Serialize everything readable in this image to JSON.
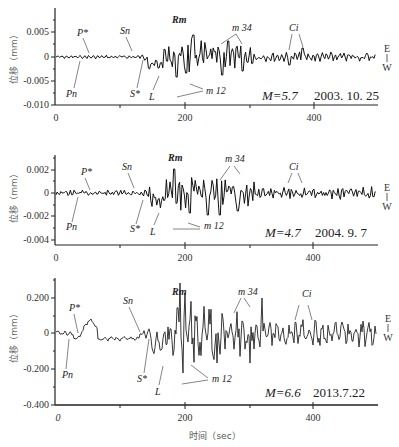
{
  "chart_data": [
    {
      "type": "line",
      "title": "",
      "annotation": "M=5.7  2003. 10. 25",
      "magnitude_label": "M=5.7",
      "date_label": "2003. 10. 25",
      "xlabel": "",
      "ylabel": "位移（mm）",
      "xlim": [
        0,
        500
      ],
      "ylim": [
        -0.01,
        0.01
      ],
      "xticks": [
        "0",
        "200",
        "400"
      ],
      "yticks": [
        "0.005",
        "0",
        "-0.005",
        "-0.010"
      ],
      "component": [
        "E",
        "W"
      ],
      "phases": [
        "P*",
        "Pn",
        "Sn",
        "S*",
        "L",
        "Rm",
        "m 12",
        "m 34",
        "Ci"
      ],
      "series": [
        {
          "name": "EW displacement",
          "peak_min": -0.008,
          "peak_max": 0.004
        }
      ]
    },
    {
      "type": "line",
      "title": "",
      "annotation": "M=4.7  2004. 9. 7",
      "magnitude_label": "M=4.7",
      "date_label": "2004. 9. 7",
      "xlabel": "",
      "ylabel": "位移（mm）",
      "xlim": [
        0,
        500
      ],
      "ylim": [
        -0.004,
        0.003
      ],
      "xticks": [
        "0",
        "200",
        "400"
      ],
      "yticks": [
        "0.002",
        "0",
        "-0.002",
        "-0.004"
      ],
      "component": [
        "E",
        "W"
      ],
      "phases": [
        "P*",
        "Pn",
        "Sn",
        "S*",
        "L",
        "Rm",
        "m 12",
        "m 34",
        "Ci"
      ],
      "series": [
        {
          "name": "EW displacement",
          "peak_min": -0.0026,
          "peak_max": 0.0022
        }
      ]
    },
    {
      "type": "line",
      "title": "",
      "annotation": "M=6.6  2013.7.22",
      "magnitude_label": "M=6.6",
      "date_label": "2013.7.22",
      "xlabel": "时间（sec）",
      "ylabel": "位移（mm）",
      "xlim": [
        0,
        500
      ],
      "ylim": [
        -0.4,
        0.3
      ],
      "xticks": [
        "0",
        "200",
        "400"
      ],
      "yticks": [
        "0.200",
        "0",
        "-0.200",
        "-0.400"
      ],
      "component": [
        "E",
        "W"
      ],
      "phases": [
        "P*",
        "Pn",
        "Sn",
        "S*",
        "L",
        "Rm",
        "m 12",
        "m 34",
        "Ci"
      ],
      "series": [
        {
          "name": "EW displacement",
          "peak_min": -0.26,
          "peak_max": 0.21
        }
      ]
    }
  ],
  "panels": [
    {
      "yticks": [
        "0.005",
        "0",
        "-0.005",
        "-0.010"
      ],
      "xticks": [
        "0",
        "200",
        "400"
      ],
      "ylabel": "位移（mm）",
      "mag": "M=5.7",
      "date": "2003. 10. 25",
      "phases": {
        "p": "P*",
        "pn": "Pn",
        "sn": "Sn",
        "s": "S*",
        "l": "L",
        "rm": "Rm",
        "m12": "m 12",
        "m34": "m 34",
        "ci": "Ci"
      },
      "e": "E",
      "w": "W"
    },
    {
      "yticks": [
        "0.002",
        "0",
        "-0.002",
        "-0.004"
      ],
      "xticks": [
        "0",
        "200",
        "400"
      ],
      "ylabel": "位移（mm）",
      "mag": "M=4.7",
      "date": "2004. 9. 7",
      "phases": {
        "p": "P*",
        "pn": "Pn",
        "sn": "Sn",
        "s": "S*",
        "l": "L",
        "rm": "Rm",
        "m12": "m 12",
        "m34": "m 34",
        "ci": "Ci"
      },
      "e": "E",
      "w": "W"
    },
    {
      "yticks": [
        "0.200",
        "0",
        "-0.200",
        "-0.400"
      ],
      "xticks": [
        "0",
        "200",
        "400"
      ],
      "ylabel": "位移（mm）",
      "mag": "M=6.6",
      "date": "2013.7.22",
      "phases": {
        "p": "P*",
        "pn": "Pn",
        "sn": "Sn",
        "s": "S*",
        "l": "L",
        "rm": "Rm",
        "m12": "m 12",
        "m34": "m 34",
        "ci": "Ci"
      },
      "e": "E",
      "w": "W"
    }
  ],
  "xlabel": "时间（sec）"
}
